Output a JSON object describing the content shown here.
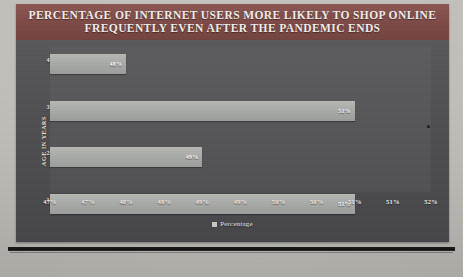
{
  "chart_data": {
    "type": "bar",
    "orientation": "horizontal",
    "title": "PERCENTAGE OF INTERNET USERS MORE LIKELY TO SHOP ONLINE FREQUENTLY EVEN AFTER THE PANDEMIC ENDS",
    "title_line1": "PERCENTAGE OF INTERNET USERS MORE LIKELY TO SHOP ONLINE",
    "title_line2": "FREQUENTLY EVEN AFTER THE PANDEMIC ENDS",
    "xlabel": "Percentage",
    "ylabel": "AGE IN YEARS",
    "categories": [
      "45-54",
      "35-44",
      "25-34",
      "16-24"
    ],
    "values": [
      48,
      51,
      49,
      51
    ],
    "value_labels": [
      "48%",
      "51%",
      "49%",
      "51%"
    ],
    "xlim": [
      47,
      52
    ],
    "xtick_labels": [
      "47%",
      "47%",
      "48%",
      "48%",
      "49%",
      "49%",
      "50%",
      "50%",
      "51%",
      "51%",
      "52%"
    ],
    "xtick_values": [
      47.0,
      47.5,
      48.0,
      48.5,
      49.0,
      49.5,
      50.0,
      50.5,
      51.0,
      51.5,
      52.0
    ],
    "grid": false,
    "legend": {
      "position": "bottom",
      "entries": [
        "Percentage"
      ]
    },
    "colors": {
      "title_band": "#7e4a47",
      "plot_background": "#535356",
      "bar_fill": "#aeb1ad",
      "text": "#f2efe9"
    }
  }
}
